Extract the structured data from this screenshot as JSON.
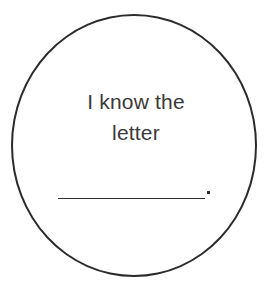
{
  "card": {
    "name": "letter-recognition-flash-card",
    "background_color": "#ffffff",
    "width": 272,
    "height": 290
  },
  "circle": {
    "name": "circle-outline",
    "stroke_color": "#2b2b2b",
    "stroke_width": "2.2px",
    "fill": "none"
  },
  "prompt": {
    "full_text": "I know the letter",
    "line_1": "I know the",
    "line_2": "letter",
    "text_color": "#3a3a3a",
    "align": "center"
  },
  "answer": {
    "blank_value": "",
    "blank_placeholder": "",
    "blank_label": "answer-blank-line",
    "punctuation": ".",
    "line_color": "#2e2e2e"
  }
}
